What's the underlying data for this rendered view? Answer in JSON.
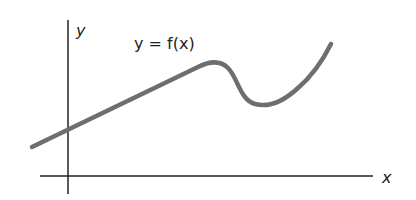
{
  "diagram": {
    "title": "y = f(x)",
    "axes": {
      "x_label": "x",
      "y_label": "y"
    },
    "curve_label": "y = f(x)",
    "colors": {
      "axis": "#222222",
      "curve": "#6e6e6e",
      "text": "#222222",
      "background": "#ffffff"
    },
    "curve_description": "Line rising from left, crossing y-axis above origin, reaching a local maximum, dipping to a local minimum, then rising steeply to the right"
  }
}
